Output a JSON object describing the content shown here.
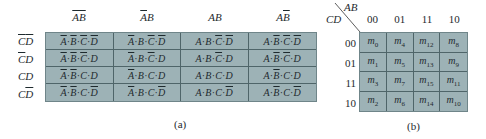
{
  "panel_a": {
    "column_headers": [
      [
        {
          "v": "A",
          "bar": true
        },
        {
          "v": "B",
          "bar": true
        }
      ],
      [
        {
          "v": "A",
          "bar": true
        },
        {
          "v": "B",
          "bar": false
        }
      ],
      [
        {
          "v": "A",
          "bar": false
        },
        {
          "v": "B",
          "bar": false
        }
      ],
      [
        {
          "v": "A",
          "bar": false
        },
        {
          "v": "B",
          "bar": true
        }
      ]
    ],
    "row_headers": [
      [
        {
          "v": "C",
          "bar": true
        },
        {
          "v": "D",
          "bar": true
        }
      ],
      [
        {
          "v": "C",
          "bar": true
        },
        {
          "v": "D",
          "bar": false
        }
      ],
      [
        {
          "v": "C",
          "bar": false
        },
        {
          "v": "D",
          "bar": false
        }
      ],
      [
        {
          "v": "C",
          "bar": false
        },
        {
          "v": "D",
          "bar": true
        }
      ]
    ],
    "separator": " · ",
    "caption": "(a)"
  },
  "panel_b": {
    "corner_top": "AB",
    "corner_left": "CD",
    "column_codes": [
      "00",
      "01",
      "11",
      "10"
    ],
    "row_codes": [
      "00",
      "01",
      "11",
      "10"
    ],
    "minterm_prefix": "m",
    "cells": [
      [
        "0",
        "4",
        "12",
        "8"
      ],
      [
        "1",
        "5",
        "13",
        "9"
      ],
      [
        "3",
        "7",
        "15",
        "11"
      ],
      [
        "2",
        "6",
        "14",
        "10"
      ]
    ],
    "caption": "(b)"
  },
  "colors": {
    "cell_fill": "#9db2b6",
    "grid_line": "#4f6569",
    "text": "#1e2a2e"
  }
}
